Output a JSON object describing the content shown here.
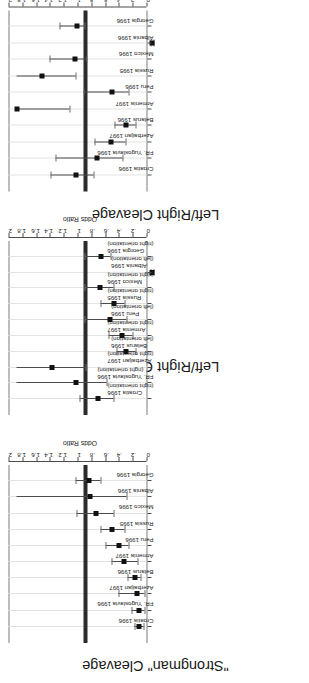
{
  "figure": {
    "axis_title": "Odds Ratio",
    "reference_line_value": 1,
    "ticks": [
      "0",
      ".2",
      ".4",
      ".6",
      ".8",
      "1",
      "1.2",
      "1.4",
      "1.6",
      "1.8",
      "2"
    ],
    "tick_values": [
      0,
      0.2,
      0.4,
      0.6,
      0.8,
      1,
      1.2,
      1.4,
      1.6,
      1.8,
      2
    ],
    "colors": {
      "reference_line": "#2b2b2b",
      "point": "#111111",
      "whisker": "#4b4b4b",
      "gridline": "#e3e3e3",
      "frame": "#7d7d7d",
      "text": "#1a1a1a",
      "background": "#ffffff"
    }
  },
  "chart_data": [
    {
      "type": "scatter",
      "panel_index": 0,
      "title": "Left/Right Cleavage",
      "subtitle": "",
      "xlabel": "",
      "ylabel": "Odds Ratio",
      "ylim": [
        0,
        2
      ],
      "grid": true,
      "reference_line": 1,
      "categories": [
        "Croatia 1996",
        "FR. Yugoslavia 1996",
        "Azerbaijan 1997",
        "Belarus 1996",
        "Armenia 1997",
        "Peru 1996",
        "Russia 1995",
        "Mexico 1996",
        "Albania 1996",
        "Georgia 1996"
      ],
      "values": [
        1.14,
        0.83,
        0.63,
        0.42,
        2.0,
        0.62,
        1.63,
        1.15,
        0.03,
        1.13
      ],
      "ci_low": [
        0.88,
        0.47,
        0.42,
        0.27,
        1.23,
        0.38,
        1.15,
        0.98,
        0.01,
        1.02
      ],
      "ci_high": [
        1.51,
        1.44,
        0.87,
        0.58,
        2.0,
        1.03,
        2.0,
        1.52,
        0.06,
        1.38
      ]
    },
    {
      "type": "scatter",
      "panel_index": 1,
      "title": "Left/Right Cleavage",
      "subtitle": "(direction aligned in incumbents' favor)",
      "xlabel": "",
      "ylabel": "Odds Ratio",
      "ylim": [
        0,
        2
      ],
      "grid": true,
      "reference_line": 1,
      "categories": [
        "Croatia 1996",
        "FR. Yugoslavia 1996",
        "Azerbaijan 1997",
        "Belarus 1996",
        "Armenia 1997",
        "Peru 1996",
        "Russia 1995",
        "Mexico 1996",
        "Albania 1996",
        "Georgia 1996"
      ],
      "sublabels": [
        "(right orientation)",
        "(right orientation)",
        "(right orientation)",
        "(left orientation)",
        "(right orientation)",
        "(left orientation)",
        "(right orientation)",
        "(right orientation)",
        "(left orientation)",
        "(right orientation)"
      ],
      "values": [
        0.82,
        1.14,
        1.49,
        0.41,
        0.47,
        0.64,
        0.59,
        0.79,
        0.03,
        0.78
      ],
      "ci_low": [
        0.59,
        0.69,
        1.0,
        0.27,
        0.32,
        0.41,
        0.44,
        0.6,
        0.01,
        0.64
      ],
      "ci_high": [
        1.08,
        2.0,
        2.0,
        0.55,
        0.66,
        1.02,
        0.78,
        1.02,
        0.06,
        1.01
      ]
    },
    {
      "type": "scatter",
      "panel_index": 2,
      "title": "\"Strongman\" Cleavage",
      "subtitle": "",
      "xlabel": "",
      "ylabel": "Odds Ratio",
      "ylim": [
        0,
        2
      ],
      "grid": true,
      "reference_line": 1,
      "categories": [
        "Croatia 1996",
        "FR. Yugoslavia 1996",
        "Azerbaijan 1997",
        "Belarus 1996",
        "Armenia 1997",
        "Peru 1996",
        "Russia 1995",
        "Mexico 1996",
        "Albania 1996",
        "Georgia 1996"
      ],
      "values": [
        0.22,
        0.22,
        0.26,
        0.28,
        0.44,
        0.52,
        0.61,
        0.85,
        0.93,
        0.95
      ],
      "ci_low": [
        0.16,
        0.14,
        0.14,
        0.2,
        0.24,
        0.38,
        0.43,
        0.59,
        0.41,
        0.78
      ],
      "ci_high": [
        0.29,
        0.33,
        0.52,
        0.39,
        0.63,
        0.71,
        0.78,
        1.13,
        2.0,
        1.14
      ]
    }
  ]
}
